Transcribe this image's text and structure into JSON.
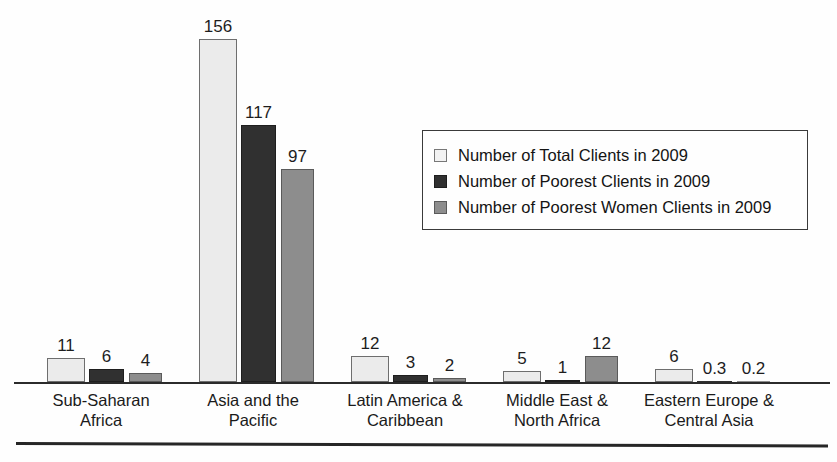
{
  "chart_data": {
    "type": "bar",
    "title": "",
    "subtitle": "",
    "xlabel": "",
    "ylabel": "",
    "grid": false,
    "legend_position": "inside-top-right",
    "ylim": [
      0,
      160
    ],
    "categories": [
      "Sub-Saharan Africa",
      "Asia and the Pacific",
      "Latin America & Caribbean",
      "Middle East & North Africa",
      "Eastern Europe & Central Asia"
    ],
    "category_lines": [
      [
        "Sub-Saharan",
        "Africa"
      ],
      [
        "Asia and the",
        "Pacific"
      ],
      [
        "Latin America &",
        "Caribbean"
      ],
      [
        "Middle East &",
        "North Africa"
      ],
      [
        "Eastern Europe &",
        "Central Asia"
      ]
    ],
    "series": [
      {
        "name": "Number of Total Clients in 2009",
        "color": "#ebebeb",
        "values": [
          11,
          156,
          12,
          5,
          6
        ],
        "labels": [
          "11",
          "156",
          "12",
          "5",
          "6"
        ]
      },
      {
        "name": "Number of Poorest Clients in 2009",
        "color": "#303030",
        "values": [
          6,
          117,
          3,
          1,
          0.3
        ],
        "labels": [
          "6",
          "117",
          "3",
          "1",
          "0.3"
        ]
      },
      {
        "name": "Number of Poorest Women Clients in 2009",
        "color": "#8d8d8d",
        "values": [
          4,
          97,
          2,
          12,
          0.2
        ],
        "labels": [
          "4",
          "97",
          "2",
          "12",
          "0.2"
        ]
      }
    ]
  },
  "legend": {
    "entries": [
      "Number of Total Clients in 2009",
      "Number of Poorest Clients in 2009",
      "Number of Poorest Women Clients in 2009"
    ]
  }
}
